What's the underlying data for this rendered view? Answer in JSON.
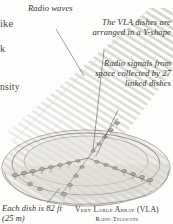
{
  "figure": {
    "title_line1": "Very Large Array (VLA)",
    "title_line2": "Radio Telescope",
    "palette": {
      "page_background": "#fdfdfc",
      "ink": "#35332f",
      "line": "#6d6a64",
      "ground_fill": "#dedbd4",
      "ground_fill_light": "#eceae4",
      "beam_stripe": "#cfcdc6",
      "dish_fill": "#b9b6ae"
    }
  },
  "callouts": [
    {
      "id": "radio-waves",
      "text": "Radio waves",
      "align": "left"
    },
    {
      "id": "y-shape",
      "text": "The VLA dishes are arranged in a Y-shape",
      "align": "right"
    },
    {
      "id": "radio-signals",
      "text": "Radio signals from space collected by 27 linked dishes",
      "align": "right"
    },
    {
      "id": "each-dish",
      "text": "Each dish is 82 ft (25 m)",
      "align": "left"
    }
  ],
  "edge_fragments": [
    {
      "id": "fragment-ike",
      "text": "ike"
    },
    {
      "id": "fragment-k",
      "text": "k"
    },
    {
      "id": "fragment-nsity",
      "text": "nsity"
    }
  ],
  "illustration": {
    "dish_count": 27,
    "arms": 3,
    "arm_labels": [
      "north-arm",
      "southwest-arm",
      "southeast-arm"
    ],
    "beam": {
      "name": "radio-wave-beam",
      "stripe_count": 22,
      "direction": "upper-right-to-lower-left"
    }
  }
}
